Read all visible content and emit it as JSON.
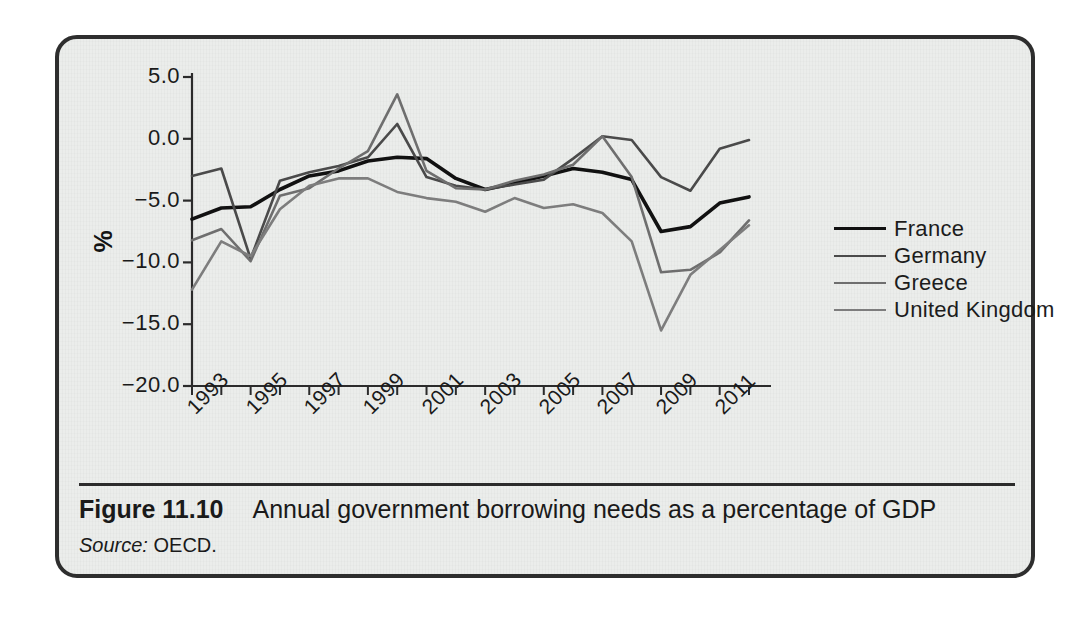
{
  "figure": {
    "label": "Figure 11.10",
    "caption": "Annual government borrowing needs as a percentage of GDP",
    "source_label": "Source:",
    "source_value": "OECD."
  },
  "chart_data": {
    "type": "line",
    "title": "Annual government borrowing needs as a percentage of GDP",
    "xlabel": "",
    "ylabel": "%",
    "ylim": [
      -20.0,
      5.0
    ],
    "xlim": [
      1993,
      2012
    ],
    "grid": false,
    "legend_position": "right",
    "ytick_labels": [
      "5.0",
      "0.0",
      "-5.0",
      "-10.0",
      "-15.0",
      "-20.0"
    ],
    "yticks": [
      5.0,
      0.0,
      -5.0,
      -10.0,
      -15.0,
      -20.0
    ],
    "x": [
      1993,
      1994,
      1995,
      1996,
      1997,
      1998,
      1999,
      2000,
      2001,
      2002,
      2003,
      2004,
      2005,
      2006,
      2007,
      2008,
      2009,
      2010,
      2011,
      2012
    ],
    "xtick_labels": [
      "1993",
      "1995",
      "1997",
      "1999",
      "2001",
      "2003",
      "2005",
      "2007",
      "2009",
      "2011"
    ],
    "xticks": [
      1993,
      1995,
      1997,
      1999,
      2001,
      2003,
      2005,
      2007,
      2009,
      2011
    ],
    "series": [
      {
        "name": "France",
        "color": "#111111",
        "width": 3.6,
        "values": [
          -6.5,
          -5.6,
          -5.5,
          -4.1,
          -3.0,
          -2.6,
          -1.8,
          -1.5,
          -1.6,
          -3.2,
          -4.1,
          -3.6,
          -3.0,
          -2.4,
          -2.7,
          -3.3,
          -7.5,
          -7.1,
          -5.2,
          -4.7
        ]
      },
      {
        "name": "Germany",
        "color": "#4a4a4a",
        "width": 2.6,
        "values": [
          -3.0,
          -2.4,
          -9.7,
          -3.4,
          -2.7,
          -2.2,
          -1.5,
          1.2,
          -3.1,
          -3.8,
          -4.1,
          -3.7,
          -3.3,
          -1.6,
          0.2,
          -0.1,
          -3.1,
          -4.2,
          -0.8,
          -0.1
        ]
      },
      {
        "name": "Greece",
        "color": "#6e6e6e",
        "width": 2.6,
        "values": [
          -8.2,
          -7.3,
          -9.9,
          -4.6,
          -4.0,
          -2.4,
          -1.0,
          3.6,
          -2.6,
          -4.0,
          -4.1,
          -3.4,
          -2.9,
          -2.1,
          0.2,
          -3.1,
          -10.8,
          -10.6,
          -9.2,
          -6.6
        ]
      },
      {
        "name": "United Kingdom",
        "color": "#7d7d7d",
        "width": 2.6,
        "values": [
          -12.2,
          -8.3,
          -9.5,
          -5.7,
          -3.8,
          -3.2,
          -3.2,
          -4.3,
          -4.8,
          -5.1,
          -5.9,
          -4.8,
          -5.6,
          -5.3,
          -6.0,
          -8.3,
          -15.5,
          -11.0,
          -9.0,
          -7.0
        ]
      }
    ]
  },
  "legend": {
    "items": [
      {
        "label": "France",
        "color": "#111111",
        "width": "3.6"
      },
      {
        "label": "Germany",
        "color": "#4a4a4a",
        "width": "2.6"
      },
      {
        "label": "Greece",
        "color": "#6e6e6e",
        "width": "2.6"
      },
      {
        "label": "United Kingdom",
        "color": "#7d7d7d",
        "width": "2.6"
      }
    ]
  }
}
